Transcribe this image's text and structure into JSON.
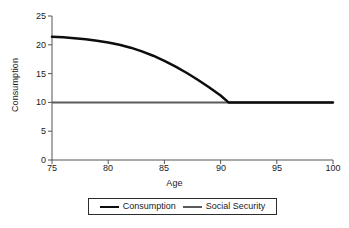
{
  "chart_data": {
    "type": "line",
    "title": "",
    "xlabel": "Age",
    "ylabel": "Consumption",
    "xlim": [
      75,
      100
    ],
    "ylim": [
      0,
      25
    ],
    "xticks": [
      75,
      80,
      85,
      90,
      95,
      100
    ],
    "yticks": [
      0,
      5,
      10,
      15,
      20,
      25
    ],
    "grid": false,
    "legend_position": "bottom-center",
    "series": [
      {
        "name": "Consumption",
        "color": "#0d0d0d",
        "linewidth": 2.5,
        "x": [
          75,
          76,
          77,
          78,
          79,
          80,
          81,
          82,
          83,
          84,
          85,
          86,
          87,
          88,
          89,
          90,
          90.7,
          91,
          92,
          93,
          94,
          95,
          96,
          97,
          98,
          99,
          100
        ],
        "y": [
          21.4,
          21.3,
          21.15,
          20.95,
          20.7,
          20.4,
          20.0,
          19.5,
          18.85,
          18.1,
          17.2,
          16.2,
          15.1,
          13.9,
          12.6,
          11.2,
          10.0,
          10.0,
          10.0,
          10.0,
          10.0,
          10.0,
          10.0,
          10.0,
          10.0,
          10.0,
          10.0
        ]
      },
      {
        "name": "Social Security",
        "color": "#5a5a5a",
        "linewidth": 2,
        "x": [
          75,
          100
        ],
        "y": [
          10,
          10
        ]
      }
    ]
  },
  "axes": {
    "x_title": "Age",
    "y_title": "Consumption",
    "x_tick_labels": [
      "75",
      "80",
      "85",
      "90",
      "95",
      "100"
    ],
    "y_tick_labels": [
      "0",
      "5",
      "10",
      "15",
      "20",
      "25"
    ]
  },
  "legend": {
    "entries": [
      {
        "label": "Consumption"
      },
      {
        "label": "Social Security"
      }
    ]
  },
  "colors": {
    "consumption_line": "#0d0d0d",
    "social_security_line": "#5a5a5a",
    "axis": "#555555",
    "text": "#1a1a1a",
    "background": "#ffffff"
  }
}
